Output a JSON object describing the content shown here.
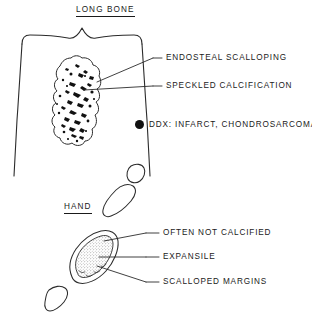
{
  "diagram": {
    "title_long_bone": "LONG BONE",
    "title_hand": "HAND",
    "long_bone": {
      "labels": [
        {
          "id": "endosteal",
          "text": "ENDOSTEAL SCALLOPING"
        },
        {
          "id": "speckled",
          "text": "SPECKLED CALCIFICATION"
        }
      ],
      "ddx": {
        "bullet": "filled-circle-bullet",
        "text": "DDX:  INFARCT,  CHONDROSARCOMA"
      }
    },
    "hand": {
      "labels": [
        {
          "id": "often-not-calcified",
          "text": "OFTEN NOT CALCIFIED"
        },
        {
          "id": "expansile",
          "text": "EXPANSILE"
        },
        {
          "id": "scalloped-margins",
          "text": "SCALLOPED MARGINS"
        }
      ]
    },
    "colors": {
      "ink": "#1a1a1a",
      "line": "#2b2b2b",
      "background": "#ffffff",
      "calcification": "#111111",
      "stipple": "#555555"
    }
  }
}
